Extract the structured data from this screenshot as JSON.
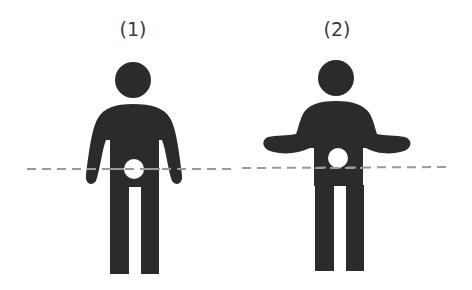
{
  "figures": [
    {
      "label": "(1)",
      "pose": "arms-down"
    },
    {
      "label": "(2)",
      "pose": "arms-out-shrug"
    }
  ],
  "colors": {
    "figure_fill": "#2b2b2b",
    "dashed_line": "#9a9a9a",
    "hip_marker": "#ffffff"
  }
}
